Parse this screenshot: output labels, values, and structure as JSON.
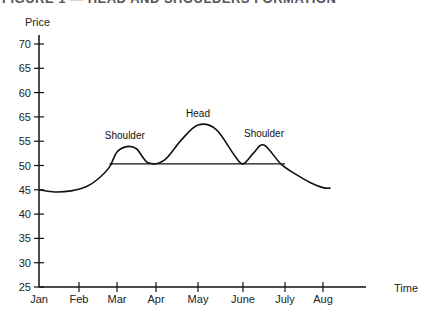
{
  "figure": {
    "clipped_title": "FIGURE 1 — HEAD AND SHOULDERS FORMATION"
  },
  "chart_data": {
    "type": "line",
    "title": "Head and Shoulders Formation",
    "xlabel": "Time",
    "ylabel": "Price",
    "x_ticks": [
      "Jan",
      "Feb",
      "Mar",
      "Apr",
      "May",
      "June",
      "July",
      "Aug"
    ],
    "y_tick_labels": [
      "70",
      "65",
      "60",
      "65",
      "55",
      "50",
      "45",
      "40",
      "35",
      "30",
      "25"
    ],
    "y_tick_values": [
      70,
      65,
      60,
      55,
      55,
      50,
      45,
      40,
      35,
      30,
      25
    ],
    "ylim": [
      25,
      72
    ],
    "grid": false,
    "series": [
      {
        "name": "Price",
        "x": [
          0.0,
          0.4,
          0.8,
          1.2,
          1.5,
          1.8,
          2.0,
          2.25,
          2.5,
          2.8,
          3.2,
          3.6,
          4.0,
          4.4,
          4.8,
          5.0,
          5.25,
          5.5,
          5.9,
          6.3,
          6.7,
          7.0,
          7.2
        ],
        "y": [
          43.0,
          42.6,
          42.8,
          43.6,
          45.0,
          47.2,
          50.0,
          51.0,
          50.6,
          48.0,
          48.5,
          52.2,
          55.0,
          54.2,
          49.5,
          47.8,
          49.8,
          51.3,
          47.8,
          45.8,
          44.2,
          43.4,
          43.3
        ]
      },
      {
        "name": "Neckline",
        "x": [
          1.8,
          6.0
        ],
        "y": [
          47.8,
          47.8
        ]
      }
    ],
    "annotations": [
      {
        "text": "Shoulder",
        "x": 2.2,
        "y": 52.5
      },
      {
        "text": "Head",
        "x": 4.0,
        "y": 56.5
      },
      {
        "text": "Shoulder",
        "x": 5.5,
        "y": 52.8
      }
    ]
  }
}
